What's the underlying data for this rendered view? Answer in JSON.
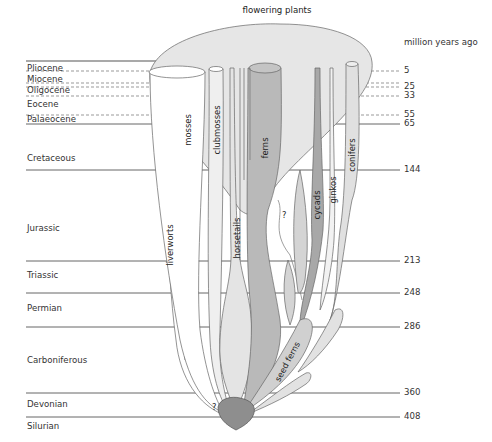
{
  "title": "flowering plants",
  "axis_label": "million years ago",
  "periods": [
    {
      "name": "Pliocene",
      "top": 63
    },
    {
      "name": "Miocene",
      "top": 74
    },
    {
      "name": "Oligocene",
      "top": 85
    },
    {
      "name": "Eocene",
      "top": 99
    },
    {
      "name": "Palaeocene",
      "top": 115
    },
    {
      "name": "Cretaceous",
      "top": 153
    },
    {
      "name": "Jurassic",
      "top": 223
    },
    {
      "name": "Triassic",
      "top": 269
    },
    {
      "name": "Permian",
      "top": 303
    },
    {
      "name": "Carboniferous",
      "top": 356
    },
    {
      "name": "Devonian",
      "top": 399
    },
    {
      "name": "Silurian",
      "top": 420
    }
  ],
  "ages": [
    {
      "value": "5",
      "y": 71
    },
    {
      "value": "25",
      "y": 87
    },
    {
      "value": "33",
      "y": 96
    },
    {
      "value": "55",
      "y": 115
    },
    {
      "value": "65",
      "y": 124
    },
    {
      "value": "144",
      "y": 170
    },
    {
      "value": "213",
      "y": 261
    },
    {
      "value": "248",
      "y": 293
    },
    {
      "value": "286",
      "y": 327
    },
    {
      "value": "360",
      "y": 393
    },
    {
      "value": "408",
      "y": 417
    }
  ],
  "lineages": {
    "liverworts": "liverworts",
    "mosses": "mosses",
    "clubmosses": "clubmosses",
    "horsetails": "horsetails",
    "ferns": "ferns",
    "cycads": "cycads",
    "ginkos": "ginkos",
    "conifers": "conifers",
    "seed_ferns": "seed ferns",
    "unknown_1": "?",
    "unknown_2": "?"
  },
  "colors": {
    "flowering": "#e6e6e6",
    "ferns": "#b9b9b9",
    "cycads": "#a8a8a8",
    "root": "#8e8e8e",
    "light": "#ececec",
    "lines": "#555555"
  }
}
